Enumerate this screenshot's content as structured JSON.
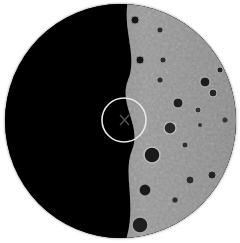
{
  "view": {
    "type": "telescope-eyepiece",
    "subject": "moon-terminator",
    "field_color": "#000000",
    "surface_color": "#8c8c8c",
    "reticle_color": "#e8e8e8"
  },
  "reticle": {
    "center_x": 124,
    "center_y": 120,
    "radius": 22,
    "crosshair": "x"
  },
  "craters": [
    {
      "x": 152,
      "y": 155,
      "r": 8
    },
    {
      "x": 170,
      "y": 128,
      "r": 6
    },
    {
      "x": 178,
      "y": 103,
      "r": 5
    },
    {
      "x": 205,
      "y": 82,
      "r": 5
    },
    {
      "x": 213,
      "y": 93,
      "r": 4
    },
    {
      "x": 220,
      "y": 70,
      "r": 3
    },
    {
      "x": 198,
      "y": 110,
      "r": 3
    },
    {
      "x": 140,
      "y": 225,
      "r": 8
    },
    {
      "x": 145,
      "y": 190,
      "r": 6
    },
    {
      "x": 163,
      "y": 60,
      "r": 3
    },
    {
      "x": 160,
      "y": 30,
      "r": 3
    },
    {
      "x": 190,
      "y": 180,
      "r": 4
    },
    {
      "x": 212,
      "y": 175,
      "r": 4
    },
    {
      "x": 185,
      "y": 145,
      "r": 3
    },
    {
      "x": 140,
      "y": 60,
      "r": 4
    },
    {
      "x": 135,
      "y": 20,
      "r": 4
    }
  ]
}
